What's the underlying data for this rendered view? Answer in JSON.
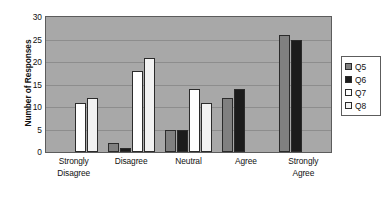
{
  "chart_data": {
    "type": "bar",
    "title": "",
    "xlabel": "",
    "ylabel": "Number of Responses",
    "ylim": [
      0,
      30
    ],
    "yticks": [
      0,
      5,
      10,
      15,
      20,
      25,
      30
    ],
    "grid": true,
    "legend_position": "right",
    "categories": [
      "Strongly Disagree",
      "Disagree",
      "Neutral",
      "Agree",
      "Strongly Agree"
    ],
    "category_lines": [
      [
        "Strongly",
        "Disagree"
      ],
      [
        "Disagree"
      ],
      [
        "Neutral"
      ],
      [
        "Agree"
      ],
      [
        "Strongly",
        "Agree"
      ]
    ],
    "series": [
      {
        "name": "Q5",
        "color": "#808080",
        "values": [
          0,
          2,
          5,
          12,
          26
        ]
      },
      {
        "name": "Q6",
        "color": "#1c1c1c",
        "values": [
          0,
          1,
          5,
          14,
          25
        ]
      },
      {
        "name": "Q7",
        "color": "#ffffff",
        "values": [
          11,
          18,
          14,
          0,
          0
        ]
      },
      {
        "name": "Q8",
        "color": "#f2f2f2",
        "values": [
          12,
          21,
          11,
          0,
          0
        ]
      }
    ]
  },
  "legend": {
    "items": [
      {
        "label": "Q5"
      },
      {
        "label": "Q6"
      },
      {
        "label": "Q7"
      },
      {
        "label": "Q8"
      }
    ]
  },
  "axis": {
    "y_tick_labels": [
      "0",
      "5",
      "10",
      "15",
      "20",
      "25",
      "30"
    ]
  }
}
